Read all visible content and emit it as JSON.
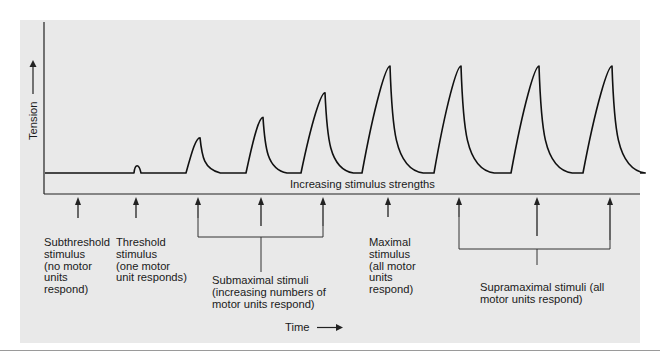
{
  "figure": {
    "y_axis_label": "Tension",
    "x_axis_label": "Time",
    "axis_caption": "Increasing stimulus strengths",
    "stimuli": [
      {
        "id": "subthreshold",
        "response": 0
      },
      {
        "id": "threshold",
        "response": 0.07
      },
      {
        "id": "submaximal-1",
        "response": 0.33
      },
      {
        "id": "submaximal-2",
        "response": 0.52
      },
      {
        "id": "submaximal-3",
        "response": 0.75
      },
      {
        "id": "maximal",
        "response": 1.0
      },
      {
        "id": "supramaximal-1",
        "response": 1.0
      },
      {
        "id": "supramaximal-2",
        "response": 1.0
      },
      {
        "id": "supramaximal-3",
        "response": 1.0
      }
    ],
    "labels": {
      "subthreshold": [
        "Subthreshold",
        "stimulus",
        "(no motor",
        "units",
        "respond)"
      ],
      "threshold": [
        "Threshold",
        "stimulus",
        "(one motor",
        "unit responds)"
      ],
      "submaximal": [
        "Submaximal stimuli",
        "(increasing numbers of",
        "motor units respond)"
      ],
      "maximal": [
        "Maximal",
        "stimulus",
        "(all motor",
        "units",
        "respond)"
      ],
      "supramaximal": [
        "Supramaximal stimuli (all",
        "motor units respond)"
      ]
    }
  }
}
